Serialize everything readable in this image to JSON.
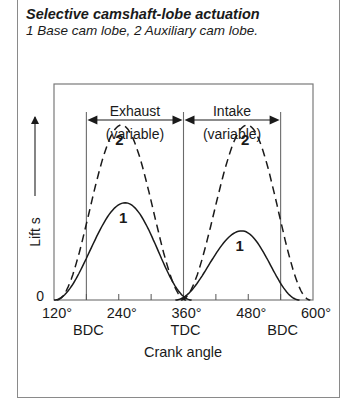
{
  "header": {
    "title": "Selective camshaft-lobe actuation",
    "subtitle": "1 Base cam lobe, 2 Auxiliary cam lobe."
  },
  "chart_data": {
    "type": "line",
    "title": "Selective camshaft-lobe actuation",
    "xlabel": "Crank angle",
    "ylabel": "Lift s",
    "xlim": [
      120,
      600
    ],
    "ylim": [
      0,
      1
    ],
    "x_ticks": [
      120,
      180,
      240,
      300,
      360,
      420,
      480,
      540,
      600
    ],
    "x_tick_labels": [
      "120°",
      "240°",
      "360°",
      "480°",
      "600°"
    ],
    "x_tick_label_values": [
      120,
      240,
      360,
      480,
      600
    ],
    "x_position_labels": [
      {
        "x": 180,
        "label": "BDC"
      },
      {
        "x": 360,
        "label": "TDC"
      },
      {
        "x": 540,
        "label": "BDC"
      }
    ],
    "y_tick_labels": [
      "0"
    ],
    "regions": [
      {
        "name": "Exhaust",
        "sub": "(variable)",
        "from": 180,
        "to": 360
      },
      {
        "name": "Intake",
        "sub": "(variable)",
        "from": 360,
        "to": 540
      }
    ],
    "series": [
      {
        "name": "1 Base cam lobe (exhaust)",
        "label": "1",
        "style": "solid",
        "start": 120,
        "peak_x": 252,
        "peak": 0.45,
        "end": 375
      },
      {
        "name": "1 Base cam lobe (intake)",
        "label": "1",
        "style": "solid",
        "start": 345,
        "peak_x": 468,
        "peak": 0.32,
        "end": 575
      },
      {
        "name": "2 Auxiliary cam lobe (exhaust)",
        "label": "2",
        "style": "dashed",
        "start": 125,
        "peak_x": 245,
        "peak": 0.81,
        "end": 365
      },
      {
        "name": "2 Auxiliary cam lobe (intake)",
        "label": "2",
        "style": "dashed",
        "start": 355,
        "peak_x": 478,
        "peak": 0.81,
        "end": 595
      }
    ],
    "legend": [
      "1 Base cam lobe",
      "2 Auxiliary cam lobe"
    ],
    "grid": false
  }
}
